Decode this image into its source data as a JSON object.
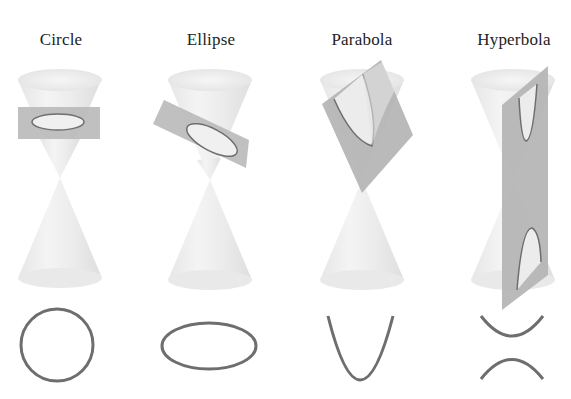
{
  "diagram": {
    "colors": {
      "background": "#ffffff",
      "cone_light": "#f2f2f2",
      "cone_mid": "#e4e4e4",
      "cone_dark": "#d6d6d6",
      "plane": "#b9b9b9",
      "plane_dark": "#aaaaaa",
      "curve": "#6e6e6e",
      "title": "#222222"
    },
    "panels": [
      {
        "id": "circle",
        "title": "Circle",
        "title_x": 61,
        "cone_cx": 60
      },
      {
        "id": "ellipse",
        "title": "Ellipse",
        "title_x": 211,
        "cone_cx": 210
      },
      {
        "id": "parabola",
        "title": "Parabola",
        "title_x": 362,
        "cone_cx": 362
      },
      {
        "id": "hyperbola",
        "title": "Hyperbola",
        "title_x": 513,
        "cone_cx": 513
      }
    ]
  }
}
